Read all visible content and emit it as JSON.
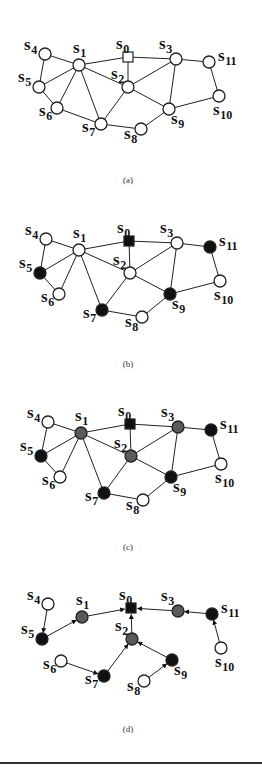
{
  "figure": {
    "colors": {
      "white": "#ffffff",
      "black": "#111111",
      "gray": "#5a5a5a",
      "stroke": "#222222"
    },
    "panels": [
      {
        "id": "a",
        "caption": "(a)",
        "caption_pos": [
          128,
          183
        ],
        "directed": false,
        "nodes": [
          {
            "id": "s0",
            "name": "s",
            "sub": "0",
            "x": 128,
            "y": 57,
            "shape": "square",
            "fill": "white",
            "lx": -12,
            "ly": -8
          },
          {
            "id": "s1",
            "name": "s",
            "sub": "1",
            "x": 79,
            "y": 65,
            "shape": "circle",
            "fill": "white",
            "lx": -6,
            "ly": -12
          },
          {
            "id": "s2",
            "name": "s",
            "sub": "2",
            "x": 128,
            "y": 87,
            "shape": "circle",
            "fill": "white",
            "lx": -17,
            "ly": -8
          },
          {
            "id": "s3",
            "name": "s",
            "sub": "3",
            "x": 176,
            "y": 59,
            "shape": "circle",
            "fill": "white",
            "lx": -17,
            "ly": -10
          },
          {
            "id": "s4",
            "name": "s",
            "sub": "4",
            "x": 45,
            "y": 54,
            "shape": "circle",
            "fill": "white",
            "lx": -21,
            "ly": -4
          },
          {
            "id": "s5",
            "name": "s",
            "sub": "5",
            "x": 39,
            "y": 87,
            "shape": "circle",
            "fill": "white",
            "lx": -21,
            "ly": -5
          },
          {
            "id": "s6",
            "name": "s",
            "sub": "6",
            "x": 57,
            "y": 108,
            "shape": "circle",
            "fill": "white",
            "lx": -18,
            "ly": 8
          },
          {
            "id": "s7",
            "name": "s",
            "sub": "7",
            "x": 101,
            "y": 124,
            "shape": "circle",
            "fill": "white",
            "lx": -19,
            "ly": 8
          },
          {
            "id": "s8",
            "name": "s",
            "sub": "8",
            "x": 141,
            "y": 129,
            "shape": "circle",
            "fill": "white",
            "lx": -17,
            "ly": 10
          },
          {
            "id": "s9",
            "name": "s",
            "sub": "9",
            "x": 169,
            "y": 109,
            "shape": "circle",
            "fill": "white",
            "lx": 2,
            "ly": 15
          },
          {
            "id": "s10",
            "name": "s",
            "sub": "10",
            "x": 219,
            "y": 96,
            "shape": "circle",
            "fill": "white",
            "lx": -6,
            "ly": 19
          },
          {
            "id": "s11",
            "name": "s",
            "sub": "11",
            "x": 209,
            "y": 62,
            "shape": "circle",
            "fill": "white",
            "lx": 9,
            "ly": -1
          }
        ],
        "edges": [
          [
            "s4",
            "s1"
          ],
          [
            "s4",
            "s5"
          ],
          [
            "s1",
            "s5"
          ],
          [
            "s1",
            "s6"
          ],
          [
            "s1",
            "s7"
          ],
          [
            "s1",
            "s2"
          ],
          [
            "s1",
            "s0"
          ],
          [
            "s5",
            "s6"
          ],
          [
            "s6",
            "s7"
          ],
          [
            "s7",
            "s2"
          ],
          [
            "s7",
            "s8"
          ],
          [
            "s0",
            "s2"
          ],
          [
            "s0",
            "s3"
          ],
          [
            "s2",
            "s3"
          ],
          [
            "s2",
            "s9"
          ],
          [
            "s3",
            "s9"
          ],
          [
            "s3",
            "s11"
          ],
          [
            "s11",
            "s10"
          ],
          [
            "s10",
            "s9"
          ],
          [
            "s9",
            "s8"
          ]
        ]
      },
      {
        "id": "b",
        "caption": "(b)",
        "caption_pos": [
          128,
          367
        ],
        "directed": false,
        "nodes": [
          {
            "id": "s0",
            "name": "s",
            "sub": "0",
            "x": 129,
            "y": 241,
            "shape": "square",
            "fill": "black",
            "lx": -12,
            "ly": -8
          },
          {
            "id": "s1",
            "name": "s",
            "sub": "1",
            "x": 79,
            "y": 250,
            "shape": "circle",
            "fill": "white",
            "lx": -6,
            "ly": -12
          },
          {
            "id": "s2",
            "name": "s",
            "sub": "2",
            "x": 130,
            "y": 273,
            "shape": "circle",
            "fill": "white",
            "lx": -17,
            "ly": -8
          },
          {
            "id": "s3",
            "name": "s",
            "sub": "3",
            "x": 177,
            "y": 243,
            "shape": "circle",
            "fill": "white",
            "lx": -17,
            "ly": -10
          },
          {
            "id": "s4",
            "name": "s",
            "sub": "4",
            "x": 46,
            "y": 239,
            "shape": "circle",
            "fill": "white",
            "lx": -21,
            "ly": -4
          },
          {
            "id": "s5",
            "name": "s",
            "sub": "5",
            "x": 40,
            "y": 273,
            "shape": "circle",
            "fill": "black",
            "lx": -21,
            "ly": -5
          },
          {
            "id": "s6",
            "name": "s",
            "sub": "6",
            "x": 59,
            "y": 294,
            "shape": "circle",
            "fill": "white",
            "lx": -18,
            "ly": 8
          },
          {
            "id": "s7",
            "name": "s",
            "sub": "7",
            "x": 102,
            "y": 310,
            "shape": "circle",
            "fill": "black",
            "lx": -19,
            "ly": 8
          },
          {
            "id": "s8",
            "name": "s",
            "sub": "8",
            "x": 142,
            "y": 317,
            "shape": "circle",
            "fill": "white",
            "lx": -17,
            "ly": 10
          },
          {
            "id": "s9",
            "name": "s",
            "sub": "9",
            "x": 170,
            "y": 294,
            "shape": "circle",
            "fill": "black",
            "lx": 2,
            "ly": 15
          },
          {
            "id": "s10",
            "name": "s",
            "sub": "10",
            "x": 220,
            "y": 281,
            "shape": "circle",
            "fill": "white",
            "lx": -6,
            "ly": 19
          },
          {
            "id": "s11",
            "name": "s",
            "sub": "11",
            "x": 210,
            "y": 247,
            "shape": "circle",
            "fill": "black",
            "lx": 9,
            "ly": -1
          }
        ],
        "edges": [
          [
            "s4",
            "s1"
          ],
          [
            "s4",
            "s5"
          ],
          [
            "s1",
            "s5"
          ],
          [
            "s1",
            "s6"
          ],
          [
            "s1",
            "s7"
          ],
          [
            "s1",
            "s2"
          ],
          [
            "s1",
            "s0"
          ],
          [
            "s5",
            "s6"
          ],
          [
            "s7",
            "s2"
          ],
          [
            "s7",
            "s8"
          ],
          [
            "s0",
            "s2"
          ],
          [
            "s0",
            "s3"
          ],
          [
            "s2",
            "s3"
          ],
          [
            "s2",
            "s9"
          ],
          [
            "s3",
            "s9"
          ],
          [
            "s3",
            "s11"
          ],
          [
            "s11",
            "s10"
          ],
          [
            "s10",
            "s9"
          ],
          [
            "s9",
            "s8"
          ]
        ]
      },
      {
        "id": "c",
        "caption": "(c)",
        "caption_pos": [
          128,
          550
        ],
        "directed": false,
        "nodes": [
          {
            "id": "s0",
            "name": "s",
            "sub": "0",
            "x": 130,
            "y": 424,
            "shape": "square",
            "fill": "black",
            "lx": -12,
            "ly": -8
          },
          {
            "id": "s1",
            "name": "s",
            "sub": "1",
            "x": 81,
            "y": 433,
            "shape": "circle",
            "fill": "gray",
            "lx": -6,
            "ly": -12
          },
          {
            "id": "s2",
            "name": "s",
            "sub": "2",
            "x": 131,
            "y": 456,
            "shape": "circle",
            "fill": "gray",
            "lx": -17,
            "ly": -8
          },
          {
            "id": "s3",
            "name": "s",
            "sub": "3",
            "x": 178,
            "y": 427,
            "shape": "circle",
            "fill": "gray",
            "lx": -17,
            "ly": -10
          },
          {
            "id": "s4",
            "name": "s",
            "sub": "4",
            "x": 48,
            "y": 422,
            "shape": "circle",
            "fill": "white",
            "lx": -21,
            "ly": -4
          },
          {
            "id": "s5",
            "name": "s",
            "sub": "5",
            "x": 41,
            "y": 456,
            "shape": "circle",
            "fill": "black",
            "lx": -21,
            "ly": -5
          },
          {
            "id": "s6",
            "name": "s",
            "sub": "6",
            "x": 60,
            "y": 477,
            "shape": "circle",
            "fill": "white",
            "lx": -18,
            "ly": 8
          },
          {
            "id": "s7",
            "name": "s",
            "sub": "7",
            "x": 104,
            "y": 493,
            "shape": "circle",
            "fill": "black",
            "lx": -19,
            "ly": 8
          },
          {
            "id": "s8",
            "name": "s",
            "sub": "8",
            "x": 143,
            "y": 500,
            "shape": "circle",
            "fill": "white",
            "lx": -17,
            "ly": 10
          },
          {
            "id": "s9",
            "name": "s",
            "sub": "9",
            "x": 171,
            "y": 477,
            "shape": "circle",
            "fill": "black",
            "lx": 2,
            "ly": 15
          },
          {
            "id": "s10",
            "name": "s",
            "sub": "10",
            "x": 221,
            "y": 464,
            "shape": "circle",
            "fill": "white",
            "lx": -6,
            "ly": 19
          },
          {
            "id": "s11",
            "name": "s",
            "sub": "11",
            "x": 211,
            "y": 430,
            "shape": "circle",
            "fill": "black",
            "lx": 9,
            "ly": -1
          }
        ],
        "edges": [
          [
            "s4",
            "s1"
          ],
          [
            "s4",
            "s5"
          ],
          [
            "s1",
            "s5"
          ],
          [
            "s1",
            "s6"
          ],
          [
            "s1",
            "s7"
          ],
          [
            "s1",
            "s2"
          ],
          [
            "s1",
            "s0"
          ],
          [
            "s5",
            "s6"
          ],
          [
            "s7",
            "s2"
          ],
          [
            "s7",
            "s8"
          ],
          [
            "s0",
            "s2"
          ],
          [
            "s0",
            "s3"
          ],
          [
            "s2",
            "s3"
          ],
          [
            "s2",
            "s9"
          ],
          [
            "s3",
            "s9"
          ],
          [
            "s3",
            "s11"
          ],
          [
            "s11",
            "s10"
          ],
          [
            "s10",
            "s9"
          ],
          [
            "s9",
            "s8"
          ]
        ]
      },
      {
        "id": "d",
        "caption": "(d)",
        "caption_pos": [
          128,
          732
        ],
        "directed": true,
        "nodes": [
          {
            "id": "s0",
            "name": "s",
            "sub": "0",
            "x": 131,
            "y": 608,
            "shape": "square",
            "fill": "black",
            "lx": -12,
            "ly": -8
          },
          {
            "id": "s1",
            "name": "s",
            "sub": "1",
            "x": 82,
            "y": 617,
            "shape": "circle",
            "fill": "gray",
            "lx": -6,
            "ly": -12
          },
          {
            "id": "s2",
            "name": "s",
            "sub": "2",
            "x": 132,
            "y": 639,
            "shape": "circle",
            "fill": "gray",
            "lx": -17,
            "ly": -8
          },
          {
            "id": "s3",
            "name": "s",
            "sub": "3",
            "x": 178,
            "y": 611,
            "shape": "circle",
            "fill": "gray",
            "lx": -17,
            "ly": -10
          },
          {
            "id": "s4",
            "name": "s",
            "sub": "4",
            "x": 48,
            "y": 604,
            "shape": "circle",
            "fill": "white",
            "lx": -21,
            "ly": -4
          },
          {
            "id": "s5",
            "name": "s",
            "sub": "5",
            "x": 42,
            "y": 639,
            "shape": "circle",
            "fill": "black",
            "lx": -21,
            "ly": -5
          },
          {
            "id": "s6",
            "name": "s",
            "sub": "6",
            "x": 61,
            "y": 661,
            "shape": "circle",
            "fill": "white",
            "lx": -18,
            "ly": 8
          },
          {
            "id": "s7",
            "name": "s",
            "sub": "7",
            "x": 104,
            "y": 676,
            "shape": "circle",
            "fill": "black",
            "lx": -19,
            "ly": 8
          },
          {
            "id": "s8",
            "name": "s",
            "sub": "8",
            "x": 144,
            "y": 681,
            "shape": "circle",
            "fill": "white",
            "lx": -17,
            "ly": 10
          },
          {
            "id": "s9",
            "name": "s",
            "sub": "9",
            "x": 172,
            "y": 660,
            "shape": "circle",
            "fill": "black",
            "lx": 2,
            "ly": 15
          },
          {
            "id": "s10",
            "name": "s",
            "sub": "10",
            "x": 221,
            "y": 648,
            "shape": "circle",
            "fill": "white",
            "lx": -6,
            "ly": 19
          },
          {
            "id": "s11",
            "name": "s",
            "sub": "11",
            "x": 212,
            "y": 614,
            "shape": "circle",
            "fill": "black",
            "lx": 9,
            "ly": -1
          }
        ],
        "edges": [
          [
            "s4",
            "s5"
          ],
          [
            "s5",
            "s1"
          ],
          [
            "s1",
            "s0"
          ],
          [
            "s2",
            "s0"
          ],
          [
            "s3",
            "s0"
          ],
          [
            "s11",
            "s3"
          ],
          [
            "s10",
            "s11"
          ],
          [
            "s7",
            "s2"
          ],
          [
            "s6",
            "s7"
          ],
          [
            "s9",
            "s2"
          ],
          [
            "s8",
            "s9"
          ]
        ]
      }
    ]
  }
}
